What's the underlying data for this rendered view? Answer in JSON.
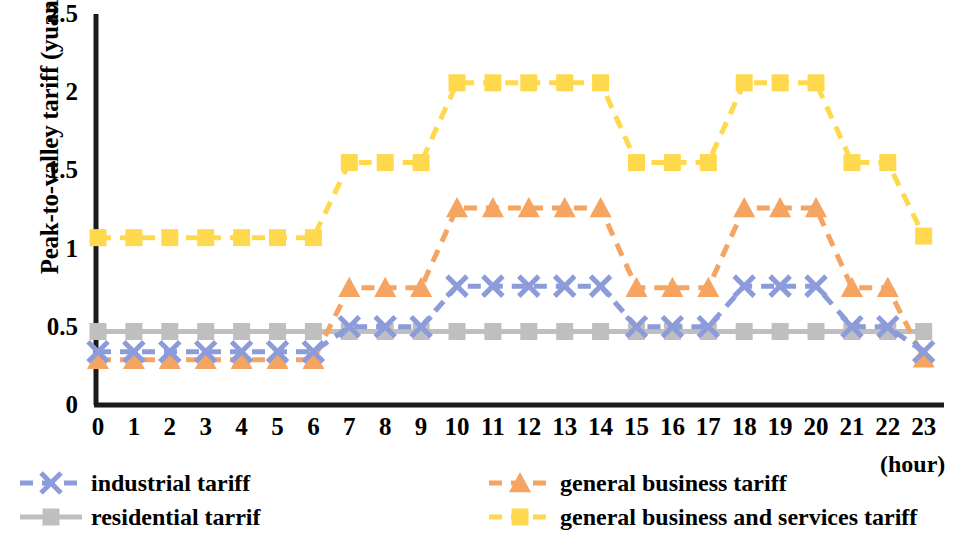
{
  "chart_data": {
    "type": "line",
    "title": "",
    "xlabel": "(hour)",
    "ylabel": "Peak-to-valley tariff (yuan/kWh)",
    "x": [
      0,
      1,
      2,
      3,
      4,
      5,
      6,
      7,
      8,
      9,
      10,
      11,
      12,
      13,
      14,
      15,
      16,
      17,
      18,
      19,
      20,
      21,
      22,
      23
    ],
    "xtick_labels": [
      "0",
      "1",
      "2",
      "3",
      "4",
      "5",
      "6",
      "7",
      "8",
      "9",
      "10",
      "11",
      "12",
      "13",
      "14",
      "15",
      "16",
      "17",
      "18",
      "19",
      "20",
      "21",
      "22",
      "23"
    ],
    "ytick_labels": [
      "0",
      "0.5",
      "1",
      "1.5",
      "2",
      "2.5"
    ],
    "ytick_values": [
      0,
      0.5,
      1,
      1.5,
      2,
      2.5
    ],
    "ylim": [
      0,
      2.5
    ],
    "xlim": [
      0,
      23
    ],
    "grid": false,
    "legend_position": "bottom",
    "series": [
      {
        "name": "industrial tariff",
        "color": "#8C9CDB",
        "marker": "x",
        "linestyle": "dashed",
        "values": [
          0.34,
          0.34,
          0.34,
          0.34,
          0.34,
          0.34,
          0.34,
          0.5,
          0.5,
          0.5,
          0.76,
          0.76,
          0.76,
          0.76,
          0.76,
          0.5,
          0.5,
          0.5,
          0.76,
          0.76,
          0.76,
          0.5,
          0.5,
          0.34
        ]
      },
      {
        "name": "residential tarrif",
        "color": "#BFBFBF",
        "marker": "square",
        "linestyle": "solid",
        "values": [
          0.47,
          0.47,
          0.47,
          0.47,
          0.47,
          0.47,
          0.47,
          0.47,
          0.47,
          0.47,
          0.47,
          0.47,
          0.47,
          0.47,
          0.47,
          0.47,
          0.47,
          0.47,
          0.47,
          0.47,
          0.47,
          0.47,
          0.47,
          0.47
        ]
      },
      {
        "name": "general business tariff",
        "color": "#F5A461",
        "marker": "triangle",
        "linestyle": "dashed",
        "values": [
          0.29,
          0.29,
          0.29,
          0.29,
          0.29,
          0.29,
          0.29,
          0.75,
          0.75,
          0.75,
          1.26,
          1.26,
          1.26,
          1.26,
          1.26,
          0.75,
          0.75,
          0.75,
          1.26,
          1.26,
          1.26,
          0.75,
          0.75,
          0.3
        ]
      },
      {
        "name": "general business and services tariff",
        "color": "#FFD94D",
        "marker": "square",
        "linestyle": "dashed",
        "values": [
          1.07,
          1.07,
          1.07,
          1.07,
          1.07,
          1.07,
          1.07,
          1.55,
          1.55,
          1.55,
          2.06,
          2.06,
          2.06,
          2.06,
          2.06,
          1.55,
          1.55,
          1.55,
          2.06,
          2.06,
          2.06,
          1.55,
          1.55,
          1.08
        ]
      }
    ]
  },
  "axis": {
    "ylabel": "Peak-to-valley tariff (yuan/kWh)",
    "xaxis_unit": "(hour)"
  },
  "legend": {
    "items": [
      {
        "label": "industrial tariff",
        "color": "#8C9CDB",
        "marker": "x",
        "linestyle": "dashed"
      },
      {
        "label": "residential tarrif",
        "color": "#BFBFBF",
        "marker": "square",
        "linestyle": "solid"
      },
      {
        "label": "general business tariff",
        "color": "#F5A461",
        "marker": "triangle",
        "linestyle": "dashed"
      },
      {
        "label": "general business and services tariff",
        "color": "#FFD94D",
        "marker": "square",
        "linestyle": "dashed"
      }
    ]
  }
}
